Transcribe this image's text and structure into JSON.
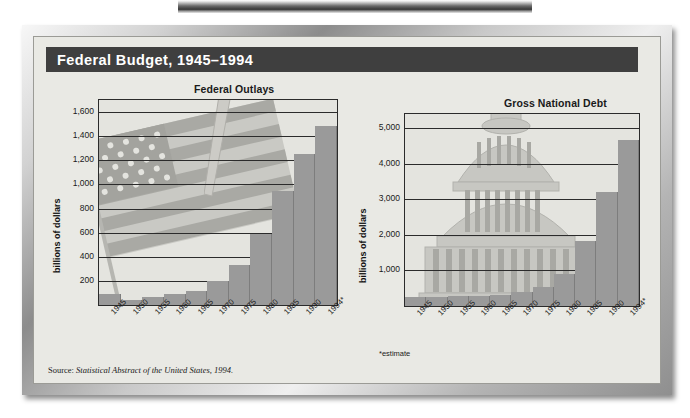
{
  "figure": {
    "title": "Federal Budget, 1945–1994",
    "source_prefix": "Source: ",
    "source_italic": "Statistical Abstract of the United States, 1994.",
    "estimate_note": "*estimate",
    "accent_bar_color": "#3f3f3f",
    "bar_color": "#9a9a9a",
    "plot_bg_color": "#e4e4df",
    "panel_bg_color": "#e9e9e4"
  },
  "chart_data": [
    {
      "type": "bar",
      "title": "Federal Outlays",
      "xlabel": "",
      "ylabel": "billions of dollars",
      "ylim": [
        0,
        1700
      ],
      "grid": true,
      "legend": "none",
      "yticks": [
        "200",
        "400",
        "600",
        "800",
        "1,000",
        "1,200",
        "1,400",
        "1,600"
      ],
      "ytick_values": [
        200,
        400,
        600,
        800,
        1000,
        1200,
        1400,
        1600
      ],
      "categories": [
        "1945",
        "1950",
        "1955",
        "1960",
        "1965",
        "1970",
        "1975",
        "1980",
        "1985",
        "1990",
        "1994*"
      ],
      "values": [
        93,
        43,
        68,
        92,
        118,
        196,
        332,
        591,
        946,
        1253,
        1484
      ],
      "watermark": "american-flag"
    },
    {
      "type": "bar",
      "title": "Gross National Debt",
      "xlabel": "",
      "ylabel": "billions of dollars",
      "ylim": [
        0,
        5400
      ],
      "grid": true,
      "legend": "none",
      "yticks": [
        "1,000",
        "2,000",
        "3,000",
        "4,000",
        "5,000"
      ],
      "ytick_values": [
        1000,
        2000,
        3000,
        4000,
        5000
      ],
      "categories": [
        "1945",
        "1950",
        "1955",
        "1960",
        "1965",
        "1970",
        "1975",
        "1980",
        "1985",
        "1990",
        "1994*"
      ],
      "values": [
        259,
        257,
        274,
        291,
        323,
        381,
        542,
        909,
        1817,
        3207,
        4677
      ],
      "watermark": "capitol-dome"
    }
  ]
}
